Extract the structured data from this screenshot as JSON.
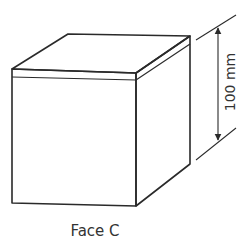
{
  "figure": {
    "caption": "Face C",
    "dimension_label": "100 mm",
    "object": "cube",
    "colors": {
      "line": "#2a2a2a",
      "text": "#333333",
      "background": "#ffffff"
    }
  }
}
